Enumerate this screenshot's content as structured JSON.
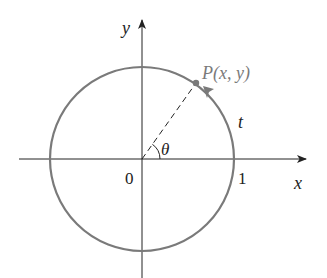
{
  "diagram": {
    "colors": {
      "axis": "#222222",
      "circle": "#7a7a7a",
      "point_label": "#7a7a7a",
      "text": "#222222"
    },
    "labels": {
      "y_axis": "y",
      "x_axis": "x",
      "point": "P(x, y)",
      "arc": "t",
      "angle": "θ",
      "origin": "0",
      "unit": "1"
    }
  }
}
